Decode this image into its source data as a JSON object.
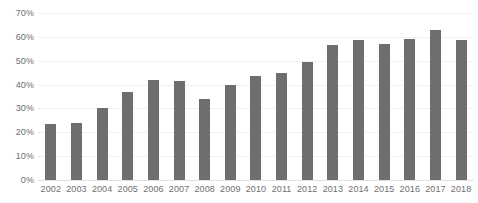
{
  "chart_data": {
    "type": "bar",
    "title": "",
    "xlabel": "",
    "ylabel": "",
    "ylim": [
      0,
      70
    ],
    "grid": true,
    "legend": false,
    "legend_position": "none",
    "bar_color": "#6e6e6e",
    "gridline_color": "#f0f0f0",
    "axis_text_color": "#6f6f6f",
    "y_ticks": [
      "0%",
      "10%",
      "20%",
      "30%",
      "40%",
      "50%",
      "60%",
      "70%"
    ],
    "y_tick_values": [
      0,
      10,
      20,
      30,
      40,
      50,
      60,
      70
    ],
    "categories": [
      "2002",
      "2003",
      "2004",
      "2005",
      "2006",
      "2007",
      "2008",
      "2009",
      "2010",
      "2011",
      "2012",
      "2013",
      "2014",
      "2015",
      "2016",
      "2017",
      "2018"
    ],
    "values": [
      23.5,
      24,
      30,
      37,
      42,
      41.5,
      34,
      40,
      43.5,
      45,
      49.5,
      56.5,
      58.5,
      57,
      59,
      63,
      58.5
    ],
    "value_unit": "%"
  }
}
